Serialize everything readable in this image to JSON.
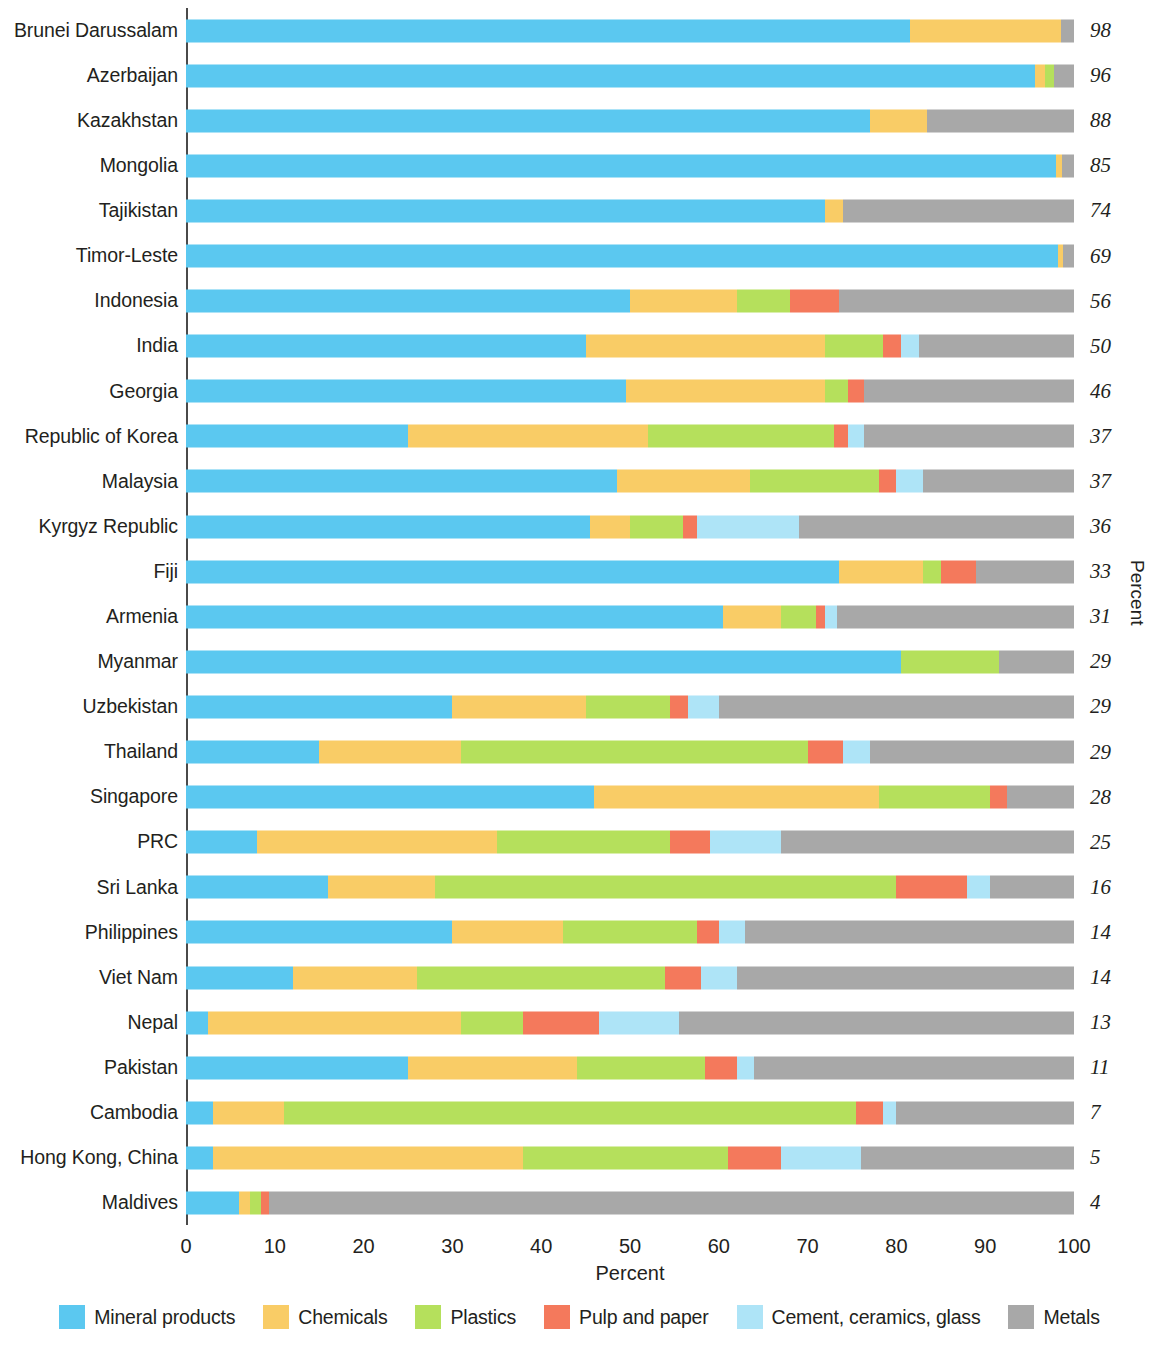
{
  "chart": {
    "type": "bar",
    "orientation": "horizontal",
    "stacked": true,
    "xlabel": "Percent",
    "ylabel_right": "Percent",
    "xlim": [
      0,
      100
    ],
    "xticks": [
      0,
      10,
      20,
      30,
      40,
      50,
      60,
      70,
      80,
      90,
      100
    ],
    "xtick_labels": [
      "0",
      "10",
      "20",
      "30",
      "40",
      "50",
      "60",
      "70",
      "80",
      "90",
      "100"
    ],
    "grid": false,
    "legend_position": "bottom"
  },
  "legend": {
    "items": [
      {
        "label": "Mineral products",
        "color": "#5bc8f0"
      },
      {
        "label": "Chemicals",
        "color": "#f9cc66"
      },
      {
        "label": "Plastics",
        "color": "#b5e05c"
      },
      {
        "label": "Pulp and paper",
        "color": "#f4795c"
      },
      {
        "label": "Cement, ceramics, glass",
        "color": "#aee4f7"
      },
      {
        "label": "Metals",
        "color": "#a8a8a8"
      }
    ]
  },
  "chart_data": {
    "type": "bar",
    "title": "",
    "xlabel": "Percent",
    "ylabel": "Percent",
    "xlim": [
      0,
      100
    ],
    "series": [
      {
        "name": "Mineral products",
        "color": "#5bc8f0"
      },
      {
        "name": "Chemicals",
        "color": "#f9cc66"
      },
      {
        "name": "Plastics",
        "color": "#b5e05c"
      },
      {
        "name": "Pulp and paper",
        "color": "#f4795c"
      },
      {
        "name": "Cement, ceramics, glass",
        "color": "#aee4f7"
      },
      {
        "name": "Metals",
        "color": "#a8a8a8"
      }
    ],
    "categories": [
      "Brunei Darussalam",
      "Azerbaijan",
      "Kazakhstan",
      "Mongolia",
      "Tajikistan",
      "Timor-Leste",
      "Indonesia",
      "India",
      "Georgia",
      "Republic of Korea",
      "Malaysia",
      "Kyrgyz Republic",
      "Fiji",
      "Armenia",
      "Myanmar",
      "Uzbekistan",
      "Thailand",
      "Singapore",
      "PRC",
      "Sri Lanka",
      "Philippines",
      "Viet Nam",
      "Nepal",
      "Pakistan",
      "Cambodia",
      "Hong Kong, China",
      "Maldives"
    ],
    "rows": [
      {
        "label": "Brunei Darussalam",
        "value": "98",
        "segments": [
          81.5,
          17.0,
          0.0,
          0.0,
          0.0,
          1.5
        ]
      },
      {
        "label": "Azerbaijan",
        "value": "96",
        "segments": [
          95.6,
          1.1,
          1.1,
          0.0,
          0.0,
          2.2
        ]
      },
      {
        "label": "Kazakhstan",
        "value": "88",
        "segments": [
          77.0,
          6.5,
          0.0,
          0.0,
          0.0,
          16.5
        ]
      },
      {
        "label": "Mongolia",
        "value": "85",
        "segments": [
          98.0,
          0.7,
          0.0,
          0.0,
          0.0,
          1.3
        ]
      },
      {
        "label": "Tajikistan",
        "value": "74",
        "segments": [
          72.0,
          2.0,
          0.0,
          0.0,
          0.0,
          26.0
        ]
      },
      {
        "label": "Timor-Leste",
        "value": "69",
        "segments": [
          98.2,
          0.6,
          0.0,
          0.0,
          0.0,
          1.2
        ]
      },
      {
        "label": "Indonesia",
        "value": "56",
        "segments": [
          50.0,
          12.0,
          6.0,
          5.5,
          0.0,
          26.5
        ]
      },
      {
        "label": "India",
        "value": "50",
        "segments": [
          45.0,
          27.0,
          6.5,
          2.0,
          2.0,
          17.5
        ]
      },
      {
        "label": "Georgia",
        "value": "46",
        "segments": [
          49.5,
          22.5,
          2.5,
          1.8,
          0.0,
          23.7
        ]
      },
      {
        "label": "Republic of Korea",
        "value": "37",
        "segments": [
          25.0,
          27.0,
          21.0,
          1.5,
          1.8,
          23.7
        ]
      },
      {
        "label": "Malaysia",
        "value": "37",
        "segments": [
          48.5,
          15.0,
          14.5,
          2.0,
          3.0,
          17.0
        ]
      },
      {
        "label": "Kyrgyz Republic",
        "value": "36",
        "segments": [
          45.5,
          4.5,
          6.0,
          1.5,
          11.5,
          31.0
        ]
      },
      {
        "label": "Fiji",
        "value": "33",
        "segments": [
          73.5,
          9.5,
          2.0,
          4.0,
          0.0,
          11.0
        ]
      },
      {
        "label": "Armenia",
        "value": "31",
        "segments": [
          60.5,
          6.5,
          4.0,
          1.0,
          1.3,
          26.7
        ]
      },
      {
        "label": "Myanmar",
        "value": "29",
        "segments": [
          80.5,
          0.0,
          11.0,
          0.0,
          0.0,
          8.5
        ]
      },
      {
        "label": "Uzbekistan",
        "value": "29",
        "segments": [
          30.0,
          15.0,
          9.5,
          2.0,
          3.5,
          40.0
        ]
      },
      {
        "label": "Thailand",
        "value": "29",
        "segments": [
          15.0,
          16.0,
          39.0,
          4.0,
          3.0,
          23.0
        ]
      },
      {
        "label": "Singapore",
        "value": "28",
        "segments": [
          46.0,
          32.0,
          12.5,
          2.0,
          0.0,
          7.5
        ]
      },
      {
        "label": "PRC",
        "value": "25",
        "segments": [
          8.0,
          27.0,
          19.5,
          4.5,
          8.0,
          33.0
        ]
      },
      {
        "label": "Sri Lanka",
        "value": "16",
        "segments": [
          16.0,
          12.0,
          52.0,
          8.0,
          2.5,
          9.5
        ]
      },
      {
        "label": "Philippines",
        "value": "14",
        "segments": [
          30.0,
          12.5,
          15.0,
          2.5,
          3.0,
          37.0
        ]
      },
      {
        "label": "Viet Nam",
        "value": "14",
        "segments": [
          12.0,
          14.0,
          28.0,
          4.0,
          4.0,
          38.0
        ]
      },
      {
        "label": "Nepal",
        "value": "13",
        "segments": [
          2.5,
          28.5,
          7.0,
          8.5,
          9.0,
          44.5
        ]
      },
      {
        "label": "Pakistan",
        "value": "11",
        "segments": [
          25.0,
          19.0,
          14.5,
          3.5,
          2.0,
          36.0
        ]
      },
      {
        "label": "Cambodia",
        "value": "7",
        "segments": [
          3.0,
          8.0,
          64.5,
          3.0,
          1.5,
          20.0
        ]
      },
      {
        "label": "Hong Kong, China",
        "value": "5",
        "segments": [
          3.0,
          35.0,
          23.0,
          6.0,
          9.0,
          24.0
        ]
      },
      {
        "label": "Maldives",
        "value": "4",
        "segments": [
          6.0,
          1.2,
          1.3,
          0.8,
          0.0,
          90.7
        ]
      }
    ]
  }
}
